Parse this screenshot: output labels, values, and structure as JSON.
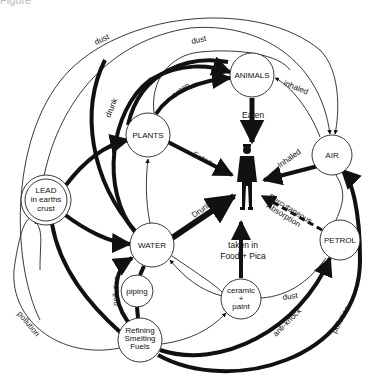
{
  "caption": "Figure",
  "nodes": {
    "animals": "ANIMALS",
    "air": "AIR",
    "plants": "PLANTS",
    "lead_l1": "LEAD",
    "lead_l2": "in earths",
    "lead_l3": "crust",
    "water": "WATER",
    "petrol": "PETROL",
    "piping": "piping",
    "ceramic_l1": "ceramic",
    "ceramic_l2": "+",
    "ceramic_l3": "paint",
    "refining_l1": "Refining",
    "refining_l2": "Smelting",
    "refining_l3": "Fuels"
  },
  "edges": {
    "dust_outer": "dust",
    "dust_inner": "dust",
    "drunk_plants": "drunk",
    "eaten_animals": "eaten",
    "inhaled_animals": "inhaled",
    "eaten_to_man": "Eaten",
    "plants_eaten_to_man": "Eaten",
    "inhaled_to_man": "Inhaled",
    "drunk_to_man": "Drunk",
    "percutaneous_l1": "Percutaneous",
    "percutaneous_l2": "Absorption",
    "taken_l1": "taken in",
    "taken_l2": "Food + Pica",
    "pollution_piping": "pollution",
    "pollution_left": "pollution",
    "dust_ceramic": "dust",
    "anti_knock": "anti-knock",
    "pollution_right": "pollution"
  },
  "colors": {
    "ink": "#111111",
    "background": "#ffffff"
  }
}
